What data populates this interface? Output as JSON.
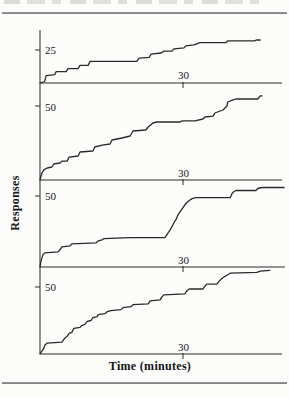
{
  "page": {
    "background_color": "#fcfcfa",
    "rule_color": "#8d8d8d"
  },
  "chart_data": {
    "type": "line",
    "subtype": "cumulative response records, 4 stacked panels, stepped curves",
    "title": "",
    "xlabel": "Time (minutes)",
    "ylabel": "Responses",
    "x_axis_tick_label": "30",
    "x_axis_tick_minutes": 30,
    "x_range_minutes": [
      0,
      50
    ],
    "grid": false,
    "legend": "none",
    "line_color": "#2a2a2a",
    "panels": [
      {
        "scale_label": "25",
        "scale_value": 25,
        "x_tick_label": "30",
        "final_value_responses": 33,
        "points": [
          [
            0,
            0
          ],
          [
            0.8,
            0.8
          ],
          [
            1,
            1.6
          ],
          [
            1.3,
            5.5
          ],
          [
            3.1,
            6.3
          ],
          [
            3.4,
            8.6
          ],
          [
            5.5,
            8.6
          ],
          [
            5.9,
            10.9
          ],
          [
            8,
            10.9
          ],
          [
            8.4,
            13.3
          ],
          [
            10.1,
            13.3
          ],
          [
            10.5,
            16.4
          ],
          [
            20.3,
            16.4
          ],
          [
            20.8,
            18.8
          ],
          [
            22.9,
            19.5
          ],
          [
            23.3,
            21.9
          ],
          [
            25.4,
            22.7
          ],
          [
            26,
            24.2
          ],
          [
            27.7,
            24.2
          ],
          [
            28.1,
            25.8
          ],
          [
            30.2,
            26.6
          ],
          [
            30.6,
            28.1
          ],
          [
            32.3,
            28.9
          ],
          [
            32.9,
            29.7
          ],
          [
            33.5,
            30.5
          ],
          [
            39,
            30.5
          ],
          [
            39.4,
            32
          ],
          [
            45,
            32
          ],
          [
            45.4,
            32.6
          ],
          [
            46.2,
            32.6
          ]
        ]
      },
      {
        "scale_label": "50",
        "scale_value": 50,
        "x_tick_label": "30",
        "final_value_responses": 57,
        "points": [
          [
            0,
            0
          ],
          [
            0.4,
            4.7
          ],
          [
            0.8,
            6.8
          ],
          [
            1.5,
            8.1
          ],
          [
            2.5,
            8.8
          ],
          [
            2.9,
            10.8
          ],
          [
            4.2,
            11.5
          ],
          [
            4.6,
            12.8
          ],
          [
            5.7,
            12.8
          ],
          [
            6.1,
            15.5
          ],
          [
            8,
            16.2
          ],
          [
            8.4,
            18.9
          ],
          [
            11.1,
            19.6
          ],
          [
            11.5,
            22.3
          ],
          [
            13,
            23.6
          ],
          [
            14.7,
            24.3
          ],
          [
            15.1,
            27
          ],
          [
            17.2,
            28.4
          ],
          [
            18.9,
            29.7
          ],
          [
            19.5,
            33.1
          ],
          [
            22.2,
            33.8
          ],
          [
            22.7,
            35.8
          ],
          [
            23.7,
            38.5
          ],
          [
            24.5,
            39.2
          ],
          [
            29.4,
            39.2
          ],
          [
            29.8,
            39.9
          ],
          [
            32.5,
            39.9
          ],
          [
            34.2,
            41.2
          ],
          [
            34.6,
            42.6
          ],
          [
            36.3,
            43.2
          ],
          [
            36.7,
            45.3
          ],
          [
            37.8,
            46.6
          ],
          [
            38.4,
            47.3
          ],
          [
            39.2,
            50
          ],
          [
            39.4,
            52.7
          ],
          [
            40.5,
            54.1
          ],
          [
            41.1,
            54.7
          ],
          [
            45.7,
            54.7
          ],
          [
            46.2,
            56.8
          ],
          [
            46.6,
            56.8
          ]
        ]
      },
      {
        "scale_label": "50",
        "scale_value": 50,
        "x_tick_label": "30",
        "final_value_responses": 56,
        "points": [
          [
            0,
            0
          ],
          [
            0.2,
            4.3
          ],
          [
            0.6,
            8.5
          ],
          [
            1,
            9.9
          ],
          [
            3.8,
            10.6
          ],
          [
            4.2,
            12.1
          ],
          [
            4.6,
            14.2
          ],
          [
            6.3,
            14.9
          ],
          [
            6.7,
            16.3
          ],
          [
            11.7,
            17
          ],
          [
            12.2,
            18.4
          ],
          [
            13,
            19.1
          ],
          [
            13.4,
            19.9
          ],
          [
            18.9,
            20.6
          ],
          [
            26.2,
            20.6
          ],
          [
            26.6,
            22.7
          ],
          [
            27.3,
            26.2
          ],
          [
            27.7,
            28.4
          ],
          [
            28.1,
            31.2
          ],
          [
            28.5,
            33.3
          ],
          [
            29,
            36.9
          ],
          [
            29.4,
            39
          ],
          [
            30,
            41.8
          ],
          [
            30.6,
            44.7
          ],
          [
            31.3,
            46.8
          ],
          [
            31.9,
            48.2
          ],
          [
            32.7,
            48.9
          ],
          [
            39.9,
            48.9
          ],
          [
            40.3,
            51.8
          ],
          [
            40.7,
            53.2
          ],
          [
            41.1,
            53.9
          ],
          [
            45.3,
            53.9
          ],
          [
            45.7,
            55.3
          ],
          [
            46.6,
            56
          ],
          [
            51.2,
            56
          ]
        ]
      },
      {
        "scale_label": "50",
        "scale_value": 50,
        "x_tick_label": "30",
        "final_value_responses": 63,
        "points": [
          [
            0,
            0
          ],
          [
            0.4,
            2.2
          ],
          [
            0.8,
            4.4
          ],
          [
            1,
            6.6
          ],
          [
            1.5,
            8.1
          ],
          [
            4.6,
            8.8
          ],
          [
            5.2,
            11.8
          ],
          [
            5.7,
            13.2
          ],
          [
            6.1,
            15.4
          ],
          [
            6.7,
            16.2
          ],
          [
            7.1,
            19.1
          ],
          [
            8.4,
            19.9
          ],
          [
            8.8,
            21.3
          ],
          [
            9.4,
            22.1
          ],
          [
            9.9,
            24.3
          ],
          [
            10.7,
            25
          ],
          [
            11.1,
            27.2
          ],
          [
            12,
            27.9
          ],
          [
            12.2,
            29.4
          ],
          [
            13.6,
            30.1
          ],
          [
            14.1,
            31.6
          ],
          [
            14.9,
            32.4
          ],
          [
            17,
            33.1
          ],
          [
            17.4,
            34.6
          ],
          [
            19.1,
            35.3
          ],
          [
            19.5,
            36.8
          ],
          [
            22.7,
            37.5
          ],
          [
            23.1,
            39.7
          ],
          [
            25.2,
            40.4
          ],
          [
            25.6,
            42.6
          ],
          [
            26,
            44.1
          ],
          [
            30.4,
            44.9
          ],
          [
            30.8,
            47.1
          ],
          [
            31.3,
            48.5
          ],
          [
            34.2,
            48.5
          ],
          [
            34.6,
            50.7
          ],
          [
            35,
            52.2
          ],
          [
            37.1,
            52.2
          ],
          [
            37.6,
            54.4
          ],
          [
            38.2,
            56.6
          ],
          [
            39.2,
            58.8
          ],
          [
            39.9,
            60.3
          ],
          [
            45.5,
            61
          ],
          [
            46.2,
            61.8
          ],
          [
            48.2,
            62.5
          ]
        ]
      }
    ]
  }
}
